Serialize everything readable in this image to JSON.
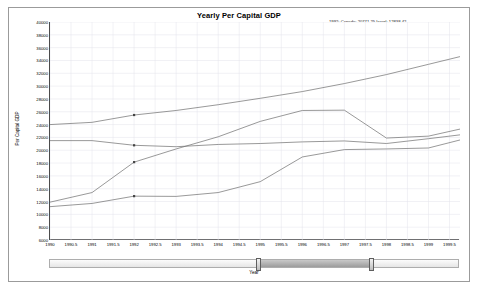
{
  "window": {
    "name": "gdp-chart-window"
  },
  "chart_data": {
    "type": "line",
    "title": "Yearly Per Capital GDP",
    "xlabel": "Year",
    "ylabel": "Per Capital GDP",
    "xlim": [
      1990,
      1999.75
    ],
    "ylim": [
      6000,
      40000
    ],
    "grid": true,
    "legend": "none",
    "x": [
      1990,
      1991,
      1992,
      1993,
      1994,
      1995,
      1996,
      1997,
      1998,
      1999,
      1999.75
    ],
    "xticks": [
      "1990",
      "1990.5",
      "1991",
      "1991.5",
      "1992",
      "1992.5",
      "1993",
      "1993.5",
      "1994",
      "1994.5",
      "1995",
      "1995.5",
      "1996",
      "1996.5",
      "1997",
      "1997.5",
      "1998",
      "1998.5",
      "1999",
      "1999.5"
    ],
    "xtick_values": [
      1990,
      1990.5,
      1991,
      1991.5,
      1992,
      1992.5,
      1993,
      1993.5,
      1994,
      1994.5,
      1995,
      1995.5,
      1996,
      1996.5,
      1997,
      1997.5,
      1998,
      1998.5,
      1999,
      1999.5
    ],
    "yticks": [
      "40000",
      "38000",
      "36000",
      "34000",
      "32000",
      "30000",
      "28000",
      "26000",
      "24000",
      "22000",
      "20000",
      "18000",
      "16000",
      "14000",
      "12000",
      "10000",
      "8000",
      "6000"
    ],
    "ytick_values": [
      40000,
      38000,
      36000,
      34000,
      32000,
      30000,
      28000,
      26000,
      24000,
      22000,
      20000,
      18000,
      16000,
      14000,
      12000,
      10000,
      8000,
      6000
    ],
    "series": [
      {
        "name": "United States",
        "color": "#6d6d6d",
        "values": [
          24000,
          24350,
          25492.95,
          26200,
          27100,
          28100,
          29150,
          30400,
          31800,
          33400,
          34600
        ]
      },
      {
        "name": "Canada",
        "color": "#6d6d6d",
        "values": [
          21500,
          21500,
          20771.25,
          20550,
          20900,
          21050,
          21300,
          21450,
          21050,
          21800,
          22400
        ]
      },
      {
        "name": "Singapore",
        "color": "#6d6d6d",
        "values": [
          11900,
          13400,
          18144.01,
          20200,
          22100,
          24500,
          26200,
          26250,
          21900,
          22200,
          23300
        ]
      },
      {
        "name": "Israel",
        "color": "#6d6d6d",
        "values": [
          11200,
          11700,
          12838.42,
          12800,
          13400,
          15100,
          18950,
          20100,
          20200,
          20350,
          21600
        ]
      }
    ],
    "marker_year": 1992,
    "markers": [
      {
        "series": "United States",
        "x": 1992,
        "y": 25492.95
      },
      {
        "series": "Canada",
        "x": 1992,
        "y": 20771.25
      },
      {
        "series": "Singapore",
        "x": 1992,
        "y": 18144.01
      },
      {
        "series": "Israel",
        "x": 1992,
        "y": 12838.42
      }
    ],
    "annotation": {
      "line1_prefix": "1992:",
      "line1": "1992: Canada: 20771.25 Israel: 12838.42",
      "line2": "Singapore: 18144.01 United States: 25492.95",
      "values": {
        "year": "1992",
        "canada": "20771.25",
        "israel": "12838.42",
        "singapore": "18144.01",
        "united_states": "25492.95"
      }
    }
  },
  "slider": {
    "name": "year-range-slider",
    "label": "Year",
    "range_start_pct": 51.0,
    "range_end_pct": 79.0
  }
}
